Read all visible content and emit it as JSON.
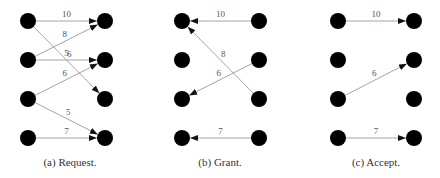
{
  "figure": {
    "rows_y": [
      21,
      60,
      99,
      138
    ],
    "node_radius": 8,
    "edge_color": "#9a9a9a",
    "arrow_color": "#111111",
    "node_color": "#000000",
    "panels": [
      {
        "id": "a",
        "caption": "(a) Request.",
        "left_x": 28,
        "right_x": 105,
        "caption_center_x": 70,
        "direction": "left-to-right",
        "edges": [
          {
            "from": 0,
            "to": 0,
            "weight": "10"
          },
          {
            "from": 1,
            "to": 0,
            "weight": "8"
          },
          {
            "from": 0,
            "to": 2,
            "weight": "6"
          },
          {
            "from": 1,
            "to": 1,
            "weight": "5"
          },
          {
            "from": 2,
            "to": 1,
            "weight": "6"
          },
          {
            "from": 2,
            "to": 3,
            "weight": "5"
          },
          {
            "from": 3,
            "to": 3,
            "weight": "7"
          }
        ]
      },
      {
        "id": "b",
        "caption": "(b) Grant.",
        "left_x": 182,
        "right_x": 259,
        "caption_center_x": 220,
        "direction": "right-to-left",
        "edges": [
          {
            "from": 0,
            "to": 0,
            "weight": "10"
          },
          {
            "from": 2,
            "to": 0,
            "weight": "8"
          },
          {
            "from": 1,
            "to": 2,
            "weight": "6"
          },
          {
            "from": 3,
            "to": 3,
            "weight": "7"
          }
        ]
      },
      {
        "id": "c",
        "caption": "(c) Accept.",
        "left_x": 338,
        "right_x": 414,
        "caption_center_x": 376,
        "direction": "left-to-right",
        "edges": [
          {
            "from": 0,
            "to": 0,
            "weight": "10"
          },
          {
            "from": 2,
            "to": 1,
            "weight": "6"
          },
          {
            "from": 3,
            "to": 3,
            "weight": "7"
          }
        ]
      }
    ]
  }
}
